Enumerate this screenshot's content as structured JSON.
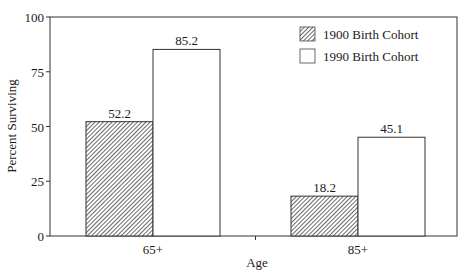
{
  "chart_data": {
    "type": "bar",
    "title": "",
    "xlabel": "Age",
    "ylabel": "Percent Surviving",
    "categories": [
      "65+",
      "85+"
    ],
    "series": [
      {
        "name": "1900 Birth Cohort",
        "values": [
          52.2,
          18.2
        ],
        "fill": "hatched",
        "color": "#555555"
      },
      {
        "name": "1990 Birth Cohort",
        "values": [
          85.2,
          45.1
        ],
        "fill": "white",
        "color": "#ffffff"
      }
    ],
    "ylim": [
      0,
      100
    ],
    "yticks": [
      0,
      25,
      50,
      75,
      100
    ],
    "ytick_labels": [
      "0",
      "25",
      "50",
      "75",
      "100"
    ],
    "data_labels": [
      [
        "52.2",
        "18.2"
      ],
      [
        "85.2",
        "45.1"
      ]
    ],
    "grid": false,
    "legend_position": "upper right, inside plot"
  },
  "legend": {
    "items": [
      {
        "label": "1900 Birth Cohort"
      },
      {
        "label": "1990 Birth Cohort"
      }
    ]
  },
  "axes": {
    "x_label": "Age",
    "y_label": "Percent Surviving",
    "y_ticks": [
      "0",
      "25",
      "50",
      "75",
      "100"
    ],
    "x_ticks": [
      "65+",
      "85+"
    ]
  }
}
